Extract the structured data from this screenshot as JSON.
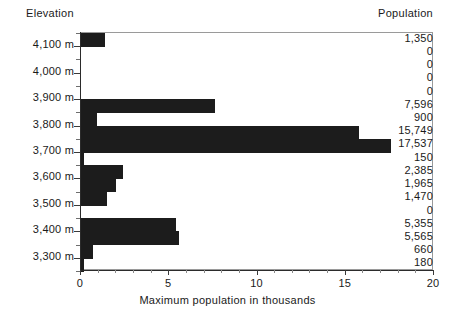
{
  "headers": {
    "elevation": "Elevation",
    "population": "Population"
  },
  "chart_data": {
    "type": "bar",
    "orientation": "horizontal",
    "title": "",
    "xlabel": "Maximum population in thousands",
    "ylabel": "Elevation",
    "xlim": [
      0,
      20
    ],
    "xticks": [
      0,
      5,
      10,
      15,
      20
    ],
    "xtick_labels": [
      "0",
      "5",
      "10",
      "15",
      "20"
    ],
    "ytick_labels": [
      "4,100 m",
      "4,000 m",
      "3,900 m",
      "3,800 m",
      "3,700 m",
      "3,600 m",
      "3,500 m",
      "3,400 m",
      "3,300 m"
    ],
    "grid": false,
    "legend": null,
    "bar_color": "#1c1c1c",
    "value_unit": "thousands",
    "categories": [
      "4,150 m",
      "4,100 m",
      "4,050 m",
      "4,000 m",
      "3,950 m",
      "3,900 m",
      "3,850 m",
      "3,800 m",
      "3,750 m",
      "3,700 m",
      "3,650 m",
      "3,600 m",
      "3,550 m",
      "3,500 m"
    ],
    "values": [
      1350,
      0,
      0,
      0,
      0,
      7596,
      900,
      15749,
      17537,
      150,
      2385,
      1965,
      1470,
      0
    ],
    "value_labels": [
      "1,350",
      "0",
      "0",
      "0",
      "0",
      "7,596",
      "900",
      "15,749",
      "17,537",
      "150",
      "2,385",
      "1,965",
      "1,470",
      "0"
    ],
    "bars": [
      {
        "label": "1,350",
        "value": 1350,
        "thousands": 1.35
      },
      {
        "label": "0",
        "value": 0,
        "thousands": 0
      },
      {
        "label": "0",
        "value": 0,
        "thousands": 0
      },
      {
        "label": "0",
        "value": 0,
        "thousands": 0
      },
      {
        "label": "0",
        "value": 0,
        "thousands": 0
      },
      {
        "label": "7,596",
        "value": 7596,
        "thousands": 7.596
      },
      {
        "label": "900",
        "value": 900,
        "thousands": 0.9
      },
      {
        "label": "15,749",
        "value": 15749,
        "thousands": 15.749
      },
      {
        "label": "17,537",
        "value": 17537,
        "thousands": 17.537
      },
      {
        "label": "150",
        "value": 150,
        "thousands": 0.15
      },
      {
        "label": "2,385",
        "value": 2385,
        "thousands": 2.385
      },
      {
        "label": "1,965",
        "value": 1965,
        "thousands": 1.965
      },
      {
        "label": "1,470",
        "value": 1470,
        "thousands": 1.47
      },
      {
        "label": "0",
        "value": 0,
        "thousands": 0
      }
    ],
    "extra_bars_below_axis": [
      {
        "label": "5,355",
        "value": 5355,
        "thousands": 5.355
      },
      {
        "label": "5,565",
        "value": 5565,
        "thousands": 5.565
      },
      {
        "label": "660",
        "value": 660,
        "thousands": 0.66
      },
      {
        "label": "180",
        "value": 180,
        "thousands": 0.18
      }
    ],
    "all_value_labels": [
      "1,350",
      "0",
      "0",
      "0",
      "0",
      "7,596",
      "900",
      "15,749",
      "17,537",
      "150",
      "2,385",
      "1,965",
      "1,470",
      "0",
      "5,355",
      "5,565",
      "660",
      "180"
    ],
    "all_values": [
      1350,
      0,
      0,
      0,
      0,
      7596,
      900,
      15749,
      17537,
      150,
      2385,
      1965,
      1470,
      0,
      5355,
      5565,
      660,
      180
    ]
  }
}
